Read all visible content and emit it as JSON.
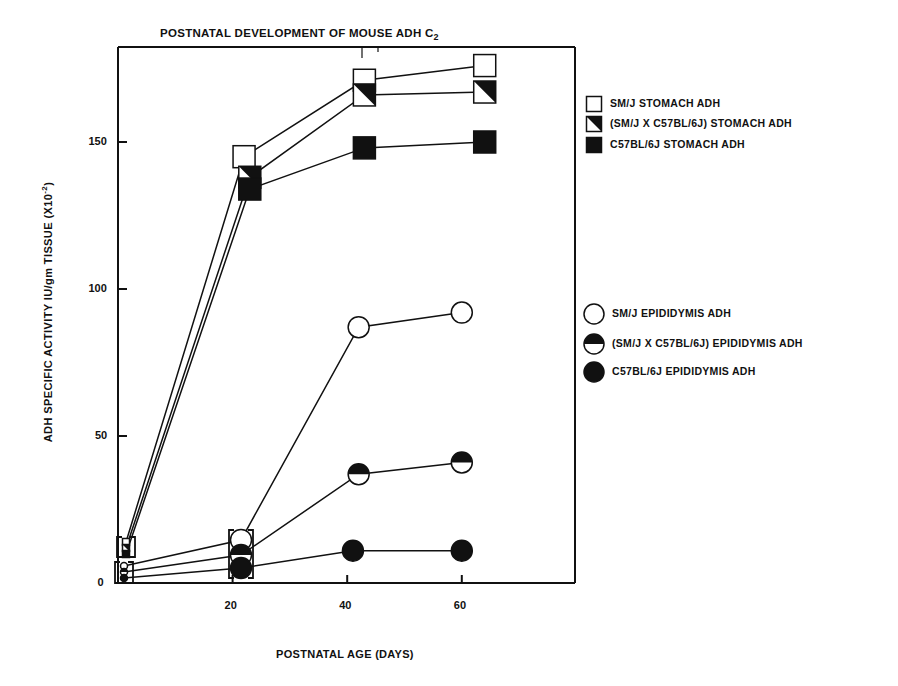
{
  "header_fragment": "",
  "chart_data": {
    "type": "line",
    "title": "POSTNATAL DEVELOPMENT OF MOUSE ADH C2",
    "title_main": "POSTNATAL DEVELOPMENT OF MOUSE ADH C",
    "title_subscript": "2",
    "xlabel": "POSTNATAL AGE (DAYS)",
    "ylabel": "ADH SPECIFIC ACTIVITY IU/gm TISSUE (X10-2)",
    "ylabel_main": "ADH  SPECIFIC ACTIVITY IU/gm TISSUE (X10",
    "ylabel_sup": "-2",
    "ylabel_end": ")",
    "xlim": [
      0,
      80
    ],
    "ylim": [
      0,
      182
    ],
    "xticks": [
      20,
      40,
      60
    ],
    "yticks": [
      0,
      50,
      100,
      150
    ],
    "grid": false,
    "legend_position": "right",
    "series": [
      {
        "name": "SM/J STOMACH ADH",
        "marker": "square-open",
        "x": [
          0,
          22,
          43,
          64
        ],
        "y": [
          12,
          145,
          171,
          176
        ]
      },
      {
        "name": "(SM/J X C57BL/6J)  STOMACH ADH",
        "marker": "square-half",
        "x": [
          0,
          23,
          43,
          64
        ],
        "y": [
          10,
          138,
          166,
          167
        ]
      },
      {
        "name": "C57BL/6J  STOMACH ADH",
        "marker": "square-filled",
        "x": [
          0,
          23,
          43,
          64
        ],
        "y": [
          8,
          134,
          148,
          150
        ]
      },
      {
        "name": "SM/J  EPIDIDYMIS ADH",
        "marker": "circle-open",
        "x": [
          0,
          20,
          42,
          60
        ],
        "y": [
          4,
          15,
          87,
          92
        ]
      },
      {
        "name": "(SM/J X C57BL/6J)  EPIDIDYMIS ADH",
        "marker": "circle-half",
        "x": [
          0,
          20,
          42,
          60
        ],
        "y": [
          3,
          9,
          37,
          41
        ]
      },
      {
        "name": "C57BL/6J  EPIDIDYMIS ADH",
        "marker": "circle-filled",
        "x": [
          0,
          20,
          41,
          60
        ],
        "y": [
          2,
          5,
          11,
          11
        ]
      }
    ],
    "annotations": [
      "Brackets group overlapping points at day 0 (stomach and epididymis) and day 20 (epididymis)"
    ]
  }
}
